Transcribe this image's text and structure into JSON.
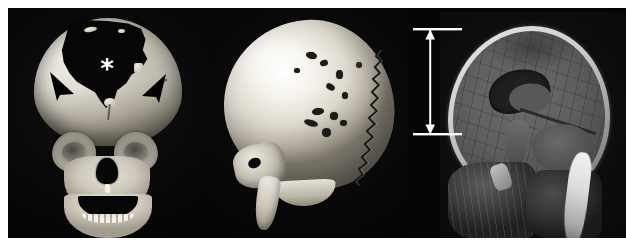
{
  "figure": {
    "width": 626,
    "height": 250,
    "background_color": "#ffffff",
    "panel_count": 3,
    "modality": "CT 3D reconstruction and MRI"
  },
  "panels": [
    {
      "id": "panel-a",
      "position": "left",
      "view": "frontal 3D CT volume-rendered reconstruction",
      "description": "Anterior view of infant skull showing a large frontal bone defect",
      "background_color": "#060606",
      "bone_color": "#e6e2d8",
      "annotations": [
        {
          "type": "asterisk",
          "glyph": "*",
          "color": "#ffffff",
          "x": 99,
          "y": 61,
          "meaning": "large frontal bone defect"
        },
        {
          "type": "arrowhead",
          "color": "#000000",
          "x": 56,
          "y": 80,
          "direction": "down-right",
          "meaning": "margin of bone defect"
        },
        {
          "type": "arrowhead",
          "color": "#000000",
          "x": 143,
          "y": 82,
          "direction": "down-left",
          "meaning": "margin of bone defect"
        }
      ]
    },
    {
      "id": "panel-b",
      "position": "middle",
      "view": "oblique / lateral 3D CT volume-rendered reconstruction",
      "description": "Lateral oblique view of calvarium showing wormian bones and a widely serrated lambdoid suture",
      "background_color": "#060606",
      "bone_color": "#f4f1ea",
      "features": [
        "serrated lambdoid suture",
        "multiple wormian bones",
        "small lucent calvarial defects",
        "mandibular ramus",
        "temporal bone"
      ]
    },
    {
      "id": "panel-c",
      "position": "right",
      "view": "sagittal T1-weighted MRI",
      "description": "Midsagittal MRI of the head showing brain, dilated lateral ventricle, posterior fossa and soft tissues",
      "background_color": "#050505",
      "brain_color": "#5f5f5f",
      "annotations": [
        {
          "type": "measurement-arrow",
          "style": "double-headed vertical arrow with horizontal end caps",
          "color": "#ffffff",
          "x": 430,
          "y_top": 29,
          "y_bottom": 134,
          "cap_x_start": 413,
          "cap_x_end": 462,
          "meaning": "vertical cranial dimension measurement"
        }
      ]
    }
  ],
  "colors": {
    "page_background": "#ffffff",
    "panel_background": "#060606",
    "bone_highlight": "#ffffff",
    "annotation_white": "#ffffff",
    "annotation_black": "#000000",
    "brain_grey": "#5f5f5f"
  }
}
